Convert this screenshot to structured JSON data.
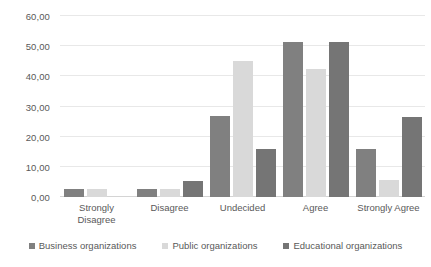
{
  "chart_data": {
    "type": "bar",
    "title": "",
    "subtitle": "",
    "xlabel": "",
    "ylabel": "",
    "ylim": [
      0,
      60
    ],
    "ytick_step": 10,
    "ytick_labels": [
      "0,00",
      "10,00",
      "20,00",
      "30,00",
      "40,00",
      "50,00",
      "60,00"
    ],
    "ytick_values": [
      0,
      10,
      20,
      30,
      40,
      50,
      60
    ],
    "grid": true,
    "legend_position": "bottom",
    "decimal_separator": ",",
    "categories": [
      "Strongly Disagree",
      "Disagree",
      "Undecided",
      "Agree",
      "Strongly Agree"
    ],
    "category_lines": [
      [
        "Strongly",
        "Disagree"
      ],
      [
        "Disagree"
      ],
      [
        "Undecided"
      ],
      [
        "Agree"
      ],
      [
        "Strongly Agree"
      ]
    ],
    "series": [
      {
        "name": "Business organizations",
        "color": "#808080",
        "values": [
          2.6,
          2.6,
          26.8,
          51.3,
          15.9
        ]
      },
      {
        "name": "Public organizations",
        "color": "#d9d9d9",
        "values": [
          2.8,
          2.8,
          45.2,
          42.3,
          5.6
        ]
      },
      {
        "name": "Educational organizations",
        "color": "#757575",
        "values": [
          0,
          5.3,
          16.0,
          51.3,
          26.5
        ]
      }
    ]
  },
  "colors": {
    "background": "#ffffff",
    "gridline": "#e8e8e8",
    "axis_line": "#d4d4d4",
    "text": "#595959"
  }
}
